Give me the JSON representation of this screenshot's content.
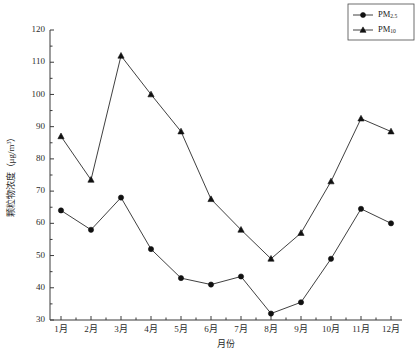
{
  "chart_data": {
    "type": "line",
    "title": "",
    "xlabel": "月份",
    "ylabel": "颗粒物浓度（μg/m³）",
    "categories": [
      "1月",
      "2月",
      "3月",
      "4月",
      "5月",
      "6月",
      "7月",
      "8月",
      "9月",
      "10月",
      "11月",
      "12月"
    ],
    "ylim": [
      30,
      120
    ],
    "yticks": [
      30,
      40,
      50,
      60,
      70,
      80,
      90,
      100,
      110,
      120
    ],
    "grid": false,
    "legend_position": "top-right",
    "series": [
      {
        "name": "PM2.5",
        "name_base": "PM",
        "name_sub": "2.5",
        "marker": "circle",
        "values": [
          64,
          58,
          68,
          52,
          43,
          41,
          43.5,
          32,
          35.5,
          49,
          64.5,
          60
        ]
      },
      {
        "name": "PM10",
        "name_base": "PM",
        "name_sub": "10",
        "marker": "triangle",
        "values": [
          87,
          73.5,
          112,
          100,
          88.5,
          67.5,
          58,
          49,
          57,
          73,
          92.5,
          88.5
        ]
      }
    ]
  },
  "axis": {
    "y_unit_prefix": "颗粒物浓度（μg/m",
    "y_unit_sup": "3",
    "y_unit_suffix": "）"
  }
}
